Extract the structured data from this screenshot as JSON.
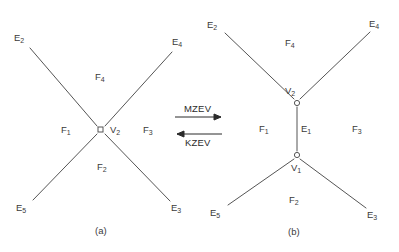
{
  "figure": {
    "background_color": "#ffffff",
    "line_color": "#555555",
    "text_color": "#3a3a3a"
  },
  "operations": {
    "forward": "MZEV",
    "backward": "KZEV"
  },
  "diagram_a": {
    "caption": "(a)",
    "vertices": [
      {
        "id": "v2",
        "label": "V",
        "sub": "2",
        "marker": "square"
      }
    ],
    "edges": [
      {
        "id": "e2",
        "label": "E",
        "sub": "2"
      },
      {
        "id": "e4",
        "label": "E",
        "sub": "4"
      },
      {
        "id": "e5",
        "label": "E",
        "sub": "5"
      },
      {
        "id": "e3",
        "label": "E",
        "sub": "3"
      }
    ],
    "faces": [
      {
        "id": "f1",
        "label": "F",
        "sub": "1"
      },
      {
        "id": "f2",
        "label": "F",
        "sub": "2"
      },
      {
        "id": "f3",
        "label": "F",
        "sub": "3"
      },
      {
        "id": "f4",
        "label": "F",
        "sub": "4"
      }
    ]
  },
  "diagram_b": {
    "caption": "(b)",
    "vertices": [
      {
        "id": "v2",
        "label": "V",
        "sub": "2",
        "marker": "circle"
      },
      {
        "id": "v1",
        "label": "V",
        "sub": "1",
        "marker": "circle"
      }
    ],
    "edges": [
      {
        "id": "e2",
        "label": "E",
        "sub": "2"
      },
      {
        "id": "e4",
        "label": "E",
        "sub": "4"
      },
      {
        "id": "e5",
        "label": "E",
        "sub": "5"
      },
      {
        "id": "e3",
        "label": "E",
        "sub": "3"
      },
      {
        "id": "e1",
        "label": "E",
        "sub": "1"
      }
    ],
    "faces": [
      {
        "id": "f1",
        "label": "F",
        "sub": "1"
      },
      {
        "id": "f2",
        "label": "F",
        "sub": "2"
      },
      {
        "id": "f3",
        "label": "F",
        "sub": "3"
      },
      {
        "id": "f4",
        "label": "F",
        "sub": "4"
      }
    ]
  }
}
